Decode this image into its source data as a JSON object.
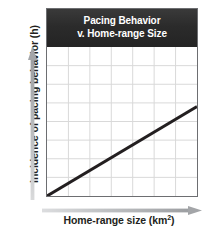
{
  "chart_data": {
    "type": "line",
    "title": "Pacing Behavior v. Home-range Size",
    "title_line_1": "Pacing Behavior",
    "title_line_2": "v. Home-range Size",
    "xlabel": "Home-range size (km",
    "xlabel_superscript": "2",
    "xlabel_suffix": ")",
    "xlabel_full": "Home-range size (km2)",
    "ylabel": "Incidence of pacing behavior (h)",
    "series": [
      {
        "name": "Pacing behavior trend",
        "x": [
          0,
          7
        ],
        "y": [
          0,
          4.8
        ]
      }
    ],
    "xlim": [
      0,
      7
    ],
    "ylim": [
      0,
      8
    ],
    "x_gridlines": 7,
    "y_gridlines": 8,
    "grid": true,
    "legend": "none",
    "xticklabels": [],
    "yticklabels": [],
    "annotations": [],
    "colors": {
      "title_bar": "#2b2b2b",
      "title_text": "#ffffff",
      "plot_background": "#ffffff",
      "grid_line": "#d8d8d8",
      "plot_border": "#6d6e71",
      "trend_line": "#231f20",
      "axis_arrow": "#a7a9ac",
      "axis_label_text": "#231f20"
    }
  },
  "axes": {
    "y": {
      "label": "Incidence of pacing behavior (h)",
      "arrow_direction": "up",
      "arrow_name": "up-arrow-icon"
    },
    "x": {
      "label_prefix": "Home-range size (km",
      "label_superscript": "2",
      "label_suffix": ")",
      "arrow_direction": "right",
      "arrow_name": "right-arrow-icon"
    }
  }
}
